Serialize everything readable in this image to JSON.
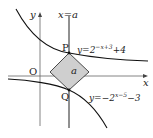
{
  "diagram": {
    "axes": {
      "x_label": "x",
      "y_label": "y",
      "origin_label": "O"
    },
    "vertical_line": {
      "label": "x=a"
    },
    "points": {
      "P": "P",
      "Q": "Q"
    },
    "square_label": "a",
    "curves": [
      {
        "name": "upper",
        "eq_prefix": "y=2",
        "exponent": "−x+3",
        "eq_suffix": "+4"
      },
      {
        "name": "lower",
        "eq_prefix": "y=−2",
        "exponent": "x−5",
        "eq_suffix": "−3"
      }
    ],
    "colors": {
      "fill": "#cfcfcf",
      "stroke": "#111111",
      "axis": "#555555"
    }
  }
}
